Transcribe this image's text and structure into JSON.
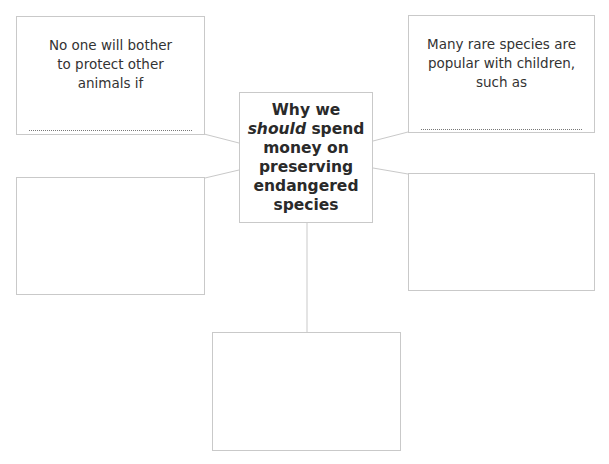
{
  "diagram": {
    "central": {
      "line1": "Why we",
      "emphasis": "should",
      "line2_rest": " spend",
      "line3": "money on",
      "line4": "preserving",
      "line5": "endangered",
      "line6": "species"
    },
    "boxes": [
      {
        "id": "top-left",
        "prompt": "No one will bother to protect other animals if",
        "answer": ""
      },
      {
        "id": "top-right",
        "prompt": "Many rare species are popular with children, such as",
        "answer": ""
      },
      {
        "id": "middle-left",
        "prompt": "",
        "answer": ""
      },
      {
        "id": "middle-right",
        "prompt": "",
        "answer": ""
      },
      {
        "id": "bottom",
        "prompt": "",
        "answer": ""
      }
    ],
    "colors": {
      "border": "#c9c9c9",
      "text": "#333333",
      "dots": "#777777"
    }
  }
}
